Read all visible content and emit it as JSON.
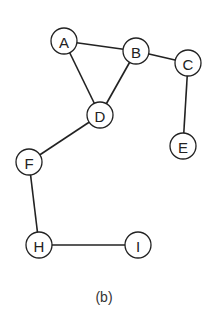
{
  "diagram": {
    "type": "undirected-graph",
    "caption": "(b)",
    "node_radius": 13,
    "nodes": [
      {
        "id": "A",
        "label": "A",
        "x": 64,
        "y": 41
      },
      {
        "id": "B",
        "label": "B",
        "x": 136,
        "y": 51
      },
      {
        "id": "C",
        "label": "C",
        "x": 188,
        "y": 63
      },
      {
        "id": "D",
        "label": "D",
        "x": 100,
        "y": 115
      },
      {
        "id": "E",
        "label": "E",
        "x": 183,
        "y": 146
      },
      {
        "id": "F",
        "label": "F",
        "x": 29,
        "y": 162
      },
      {
        "id": "H",
        "label": "H",
        "x": 39,
        "y": 245
      },
      {
        "id": "I",
        "label": "I",
        "x": 138,
        "y": 245
      }
    ],
    "edges": [
      {
        "from": "A",
        "to": "B"
      },
      {
        "from": "A",
        "to": "D"
      },
      {
        "from": "B",
        "to": "D"
      },
      {
        "from": "B",
        "to": "C"
      },
      {
        "from": "C",
        "to": "E"
      },
      {
        "from": "D",
        "to": "F"
      },
      {
        "from": "F",
        "to": "H"
      },
      {
        "from": "H",
        "to": "I"
      }
    ],
    "colors": {
      "stroke": "#222222",
      "fill": "#ffffff",
      "text": "#222222"
    }
  }
}
